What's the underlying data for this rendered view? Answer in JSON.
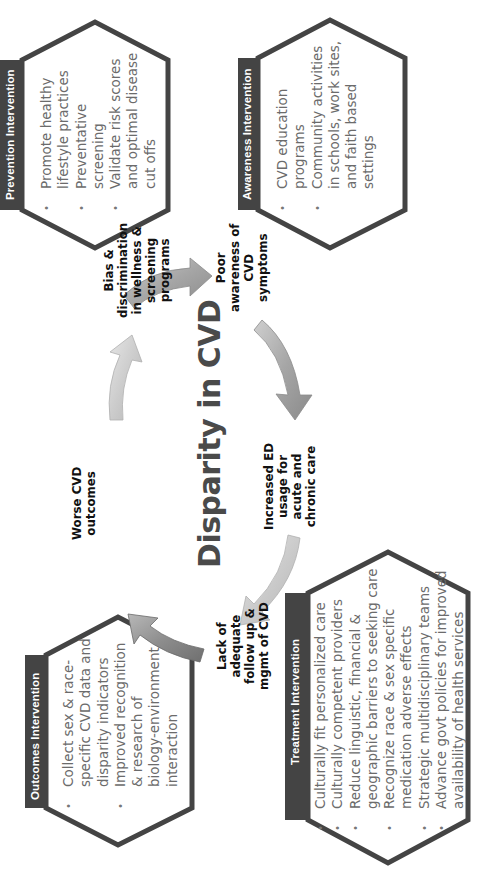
{
  "diagram": {
    "title": "Disparity in CVD",
    "orientation": "rotated -90deg",
    "colors": {
      "hexagon_stroke": "#444444",
      "label_bar": "#444444",
      "label_text": "#ffffff",
      "bullet_text": "#6b6b6b",
      "arrow_gray": "#9a9a9a",
      "arrow_light": "#d0d0d0"
    },
    "cycle_nodes": [
      {
        "id": "bias",
        "lines": [
          "Bias &",
          "discrimination",
          "in wellness &",
          "screening",
          "programs"
        ]
      },
      {
        "id": "poor_awareness",
        "lines": [
          "Poor",
          "awareness of",
          "CVD",
          "symptoms"
        ]
      },
      {
        "id": "increased_ed",
        "lines": [
          "Increased ED",
          "usage for",
          "acute and",
          "chronic care"
        ]
      },
      {
        "id": "lack_followup",
        "lines": [
          "Lack of",
          "adequate",
          "follow up &",
          "mgmt of CVD"
        ]
      },
      {
        "id": "worse_outcomes",
        "lines": [
          "Worse CVD",
          "outcomes"
        ]
      }
    ],
    "interventions": {
      "prevention": {
        "label": "Prevention Intervention",
        "items": [
          {
            "lines": [
              "Promote  healthy",
              "lifestyle practices"
            ]
          },
          {
            "lines": [
              "Preventative",
              "screening"
            ]
          },
          {
            "lines": [
              "Validate risk scores",
              "and optimal disease",
              "cut offs"
            ]
          }
        ]
      },
      "awareness": {
        "label": "Awareness  Intervention",
        "items": [
          {
            "lines": [
              "CVD education",
              "programs"
            ]
          },
          {
            "lines": [
              "Community activities",
              "in schools, work sites,",
              "and faith based",
              "settings"
            ]
          }
        ]
      },
      "outcomes": {
        "label": "Outcomes Intervention",
        "items": [
          {
            "lines": [
              "Collect sex & race-",
              "specific CVD data and",
              "disparity indicators"
            ]
          },
          {
            "lines": [
              "Improved recognition",
              "& research of",
              "biology-environment",
              "interaction"
            ]
          }
        ]
      },
      "treatment": {
        "label": "Treatment  Intervention",
        "items": [
          {
            "lines": [
              "Culturally fit personalized  care"
            ]
          },
          {
            "lines": [
              "Culturally competent providers"
            ]
          },
          {
            "lines": [
              "Reduce linguistic, financial &",
              "geographic barriers to seeking care"
            ]
          },
          {
            "lines": [
              "Recognize race & sex specific",
              "medication adverse effects"
            ]
          },
          {
            "lines": [
              "Strategic multidisciplinary teams"
            ]
          },
          {
            "lines": [
              "Advance govt policies for improved",
              "availability of health services"
            ]
          }
        ]
      }
    }
  }
}
